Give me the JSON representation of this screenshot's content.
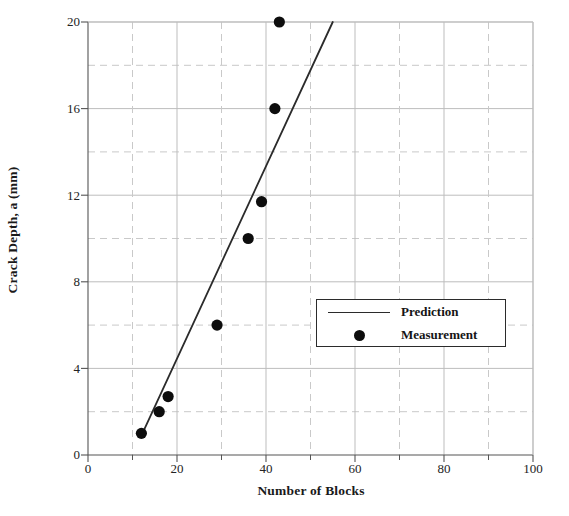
{
  "chart_data": {
    "type": "scatter",
    "title": "",
    "xlabel": "Number of Blocks",
    "ylabel": "Crack Depth, a (mm)",
    "xlim": [
      0,
      100
    ],
    "ylim": [
      0,
      20
    ],
    "x_ticks_major": [
      0,
      20,
      40,
      60,
      80,
      100
    ],
    "x_ticks_minor": [
      10,
      30,
      50,
      70,
      90
    ],
    "y_ticks_major": [
      0,
      4,
      8,
      12,
      16,
      20
    ],
    "y_ticks_minor": [
      2,
      6,
      10,
      14,
      18
    ],
    "grid": "major solid light, minor dashed light",
    "legend_position": "center-right inside plot",
    "series": [
      {
        "name": "Prediction",
        "type": "line",
        "color": "#2b2b2b",
        "x": [
          12,
          55
        ],
        "y": [
          0.9,
          20
        ]
      },
      {
        "name": "Measurement",
        "type": "scatter",
        "color": "#0d0d0d",
        "points": [
          {
            "x": 12,
            "y": 1.0
          },
          {
            "x": 16,
            "y": 2.0
          },
          {
            "x": 18,
            "y": 2.7
          },
          {
            "x": 29,
            "y": 6.0
          },
          {
            "x": 36,
            "y": 10.0
          },
          {
            "x": 39,
            "y": 11.7
          },
          {
            "x": 42,
            "y": 16.0
          },
          {
            "x": 43,
            "y": 20.0
          }
        ]
      }
    ]
  },
  "axes": {
    "y_title": "Crack Depth, a (mm)",
    "x_title": "Number of Blocks",
    "y_tick_labels": [
      "20",
      "16",
      "12",
      "8",
      "4",
      "0"
    ],
    "x_tick_labels": [
      "0",
      "20",
      "40",
      "60",
      "80",
      "100"
    ]
  },
  "legend": {
    "entries": [
      {
        "label": "Prediction",
        "key": "line-key"
      },
      {
        "label": "Measurement",
        "key": "dot-key"
      }
    ]
  },
  "colors": {
    "line": "#2b2b2b",
    "marker": "#0d0d0d",
    "axis": "#555555",
    "grid_major": "#bdbdbd",
    "grid_minor": "#c9c9c9",
    "text": "#151515",
    "background": "#ffffff"
  }
}
